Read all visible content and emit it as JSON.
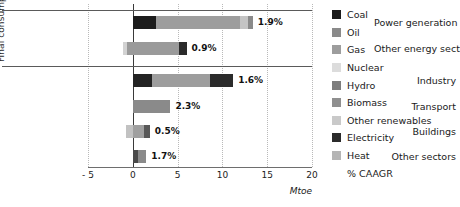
{
  "chart_data": {
    "type": "bar",
    "orientation": "horizontal",
    "stacked": true,
    "title": "",
    "xlabel": "Mtoe",
    "ylabel": "Final consumption",
    "xlim": [
      -5,
      20
    ],
    "xticks": [
      -5,
      0,
      5,
      10,
      15,
      20
    ],
    "xtick_labels": [
      "- 5",
      "0",
      "5",
      "10",
      "15",
      "20"
    ],
    "grid": "vertical-dotted",
    "legend_position": "right",
    "legend": [
      {
        "label": "Coal",
        "color": "#1c1c1c"
      },
      {
        "label": "Oil",
        "color": "#8a8a8a"
      },
      {
        "label": "Gas",
        "color": "#9d9d9d"
      },
      {
        "label": "Nuclear",
        "color": "#dcdcdc"
      },
      {
        "label": "Hydro",
        "color": "#7d7d7d"
      },
      {
        "label": "Biomass",
        "color": "#8f8f8f"
      },
      {
        "label": "Other renewables",
        "color": "#c9c9c9"
      },
      {
        "label": "Electricity",
        "color": "#2b2b2b"
      },
      {
        "label": "Heat",
        "color": "#b5b5b5"
      },
      {
        "label": "% CAAGR",
        "color": "none"
      }
    ],
    "groups": [
      {
        "name": "Transformation",
        "categories": [
          "Power generation",
          "Other energy sector"
        ]
      },
      {
        "name": "Final consumption",
        "categories": [
          "Industry",
          "Transport",
          "Buildings",
          "Other sectors"
        ]
      }
    ],
    "categories": [
      "Power generation",
      "Other energy sector",
      "Industry",
      "Transport",
      "Buildings",
      "Other sectors"
    ],
    "caagr_labels": [
      "1.9%",
      "0.9%",
      "1.6%",
      "2.3%",
      "0.5%",
      "1.7%"
    ],
    "bars": [
      {
        "category": "Power generation",
        "caagr": "1.9%",
        "total": 13.4,
        "segments": [
          {
            "series": "Coal",
            "start": 0.0,
            "end": 2.6,
            "value": 2.6,
            "color": "#1c1c1c"
          },
          {
            "series": "Gas",
            "start": 2.6,
            "end": 12.0,
            "value": 9.4,
            "color": "#9d9d9d"
          },
          {
            "series": "Other renewables",
            "start": 12.0,
            "end": 12.9,
            "value": 0.9,
            "color": "#c4c4c4"
          },
          {
            "series": "Hydro",
            "start": 12.9,
            "end": 13.4,
            "value": 0.5,
            "color": "#8a8a8a"
          }
        ]
      },
      {
        "category": "Other energy sector",
        "caagr": "0.9%",
        "total": 4.9,
        "segments": [
          {
            "series": "Nuclear",
            "start": -1.1,
            "end": -0.7,
            "value": 0.4,
            "color": "#d2d2d2"
          },
          {
            "series": "Gas",
            "start": -0.7,
            "end": 5.2,
            "value": 5.9,
            "color": "#9a9a9a"
          },
          {
            "series": "Electricity",
            "start": 5.2,
            "end": 6.0,
            "value": 0.8,
            "color": "#2b2b2b"
          }
        ]
      },
      {
        "category": "Industry",
        "caagr": "1.6%",
        "total": 11.2,
        "segments": [
          {
            "series": "Coal",
            "start": 0.0,
            "end": 2.1,
            "value": 2.1,
            "color": "#232323"
          },
          {
            "series": "Gas",
            "start": 2.1,
            "end": 8.6,
            "value": 6.5,
            "color": "#9d9d9d"
          },
          {
            "series": "Electricity",
            "start": 8.6,
            "end": 11.2,
            "value": 2.6,
            "color": "#2b2b2b"
          }
        ]
      },
      {
        "category": "Transport",
        "caagr": "2.3%",
        "total": 4.2,
        "segments": [
          {
            "series": "Oil",
            "start": 0.0,
            "end": 4.2,
            "value": 4.2,
            "color": "#8a8a8a"
          }
        ]
      },
      {
        "category": "Buildings",
        "caagr": "0.5%",
        "total": 1.9,
        "segments": [
          {
            "series": "Biomass",
            "start": -0.8,
            "end": 0.0,
            "value": 0.8,
            "color": "#c2c2c2"
          },
          {
            "series": "Gas",
            "start": 0.0,
            "end": 1.2,
            "value": 1.2,
            "color": "#a0a0a0"
          },
          {
            "series": "Electricity",
            "start": 1.2,
            "end": 1.9,
            "value": 0.7,
            "color": "#585858"
          }
        ]
      },
      {
        "category": "Other sectors",
        "caagr": "1.7%",
        "total": 1.5,
        "segments": [
          {
            "series": "Gas",
            "start": 0.0,
            "end": 0.6,
            "value": 0.6,
            "color": "#4a4a4a"
          },
          {
            "series": "Electricity",
            "start": 0.6,
            "end": 1.5,
            "value": 0.9,
            "color": "#8a8a8a"
          }
        ]
      }
    ]
  },
  "axis": {
    "unit": "Mtoe",
    "ylabel": "Final consumption",
    "ticks": [
      "- 5",
      "0",
      "5",
      "10",
      "15",
      "20"
    ]
  }
}
